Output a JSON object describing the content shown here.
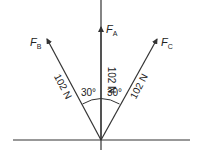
{
  "diagram": {
    "type": "force-vector-diagram",
    "forces": [
      {
        "name": "F",
        "subscript": "A",
        "magnitude_label": "102 N",
        "direction": "vertical"
      },
      {
        "name": "F",
        "subscript": "B",
        "magnitude_label": "102 N",
        "direction": "30° left of vertical"
      },
      {
        "name": "F",
        "subscript": "C",
        "magnitude_label": "102 N",
        "direction": "30° right of vertical"
      }
    ],
    "angles": [
      {
        "label": "30°",
        "between": "F_B and F_A"
      },
      {
        "label": "30°",
        "between": "F_A and F_C"
      }
    ],
    "line_color": "#333333"
  }
}
